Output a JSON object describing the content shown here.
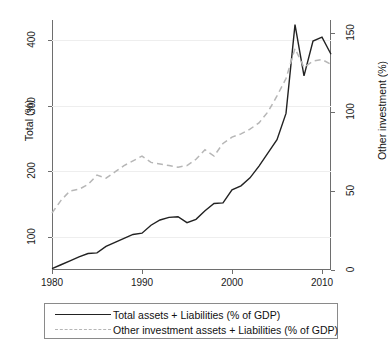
{
  "chart_data": {
    "type": "line",
    "title": "",
    "xlabel": "",
    "ylabel": "Total (%)",
    "y2label": "Other investment (%)",
    "xlim": [
      1980,
      2011
    ],
    "ylim": [
      50,
      430
    ],
    "y2lim": [
      0,
      158
    ],
    "grid": true,
    "grid_axis": "y",
    "legend_position": "bottom",
    "xticks": [
      1980,
      1990,
      2000,
      2010
    ],
    "xtick_labels": [
      "1980",
      "1990",
      "2000",
      "2010"
    ],
    "yticks": [
      100,
      200,
      300,
      400
    ],
    "ytick_labels": [
      "100",
      "200",
      "300",
      "400"
    ],
    "y2ticks": [
      0,
      50,
      100,
      150
    ],
    "y2tick_labels": [
      "0",
      "50",
      "100",
      "150"
    ],
    "x": [
      1980,
      1981,
      1982,
      1983,
      1984,
      1985,
      1986,
      1987,
      1988,
      1989,
      1990,
      1991,
      1992,
      1993,
      1994,
      1995,
      1996,
      1997,
      1998,
      1999,
      2000,
      2001,
      2002,
      2003,
      2004,
      2005,
      2006,
      2007,
      2008,
      2009,
      2010,
      2011
    ],
    "series": [
      {
        "name": "Total assets + Liabilities (% of GDP)",
        "axis": "left",
        "style": "solid",
        "color": "#222222",
        "values": [
          52,
          58,
          64,
          70,
          75,
          76,
          86,
          92,
          98,
          104,
          106,
          118,
          126,
          130,
          131,
          122,
          127,
          140,
          151,
          152,
          172,
          178,
          190,
          208,
          228,
          248,
          288,
          423,
          345,
          398,
          404,
          378
        ]
      },
      {
        "name": "Other investment assets + Liabilities (% of GDP)",
        "axis": "right",
        "style": "dashed",
        "color": "#b6b6b6",
        "values": [
          36,
          44,
          50,
          51,
          54,
          60,
          58,
          62,
          66,
          69,
          72,
          68,
          67,
          66,
          65,
          66,
          70,
          76,
          72,
          80,
          84,
          86,
          89,
          93,
          100,
          110,
          121,
          140,
          128,
          132,
          133,
          130
        ]
      }
    ]
  },
  "axes": {
    "left_title": "Total (%)",
    "right_title": "Other investment (%)"
  },
  "legend": {
    "items": [
      {
        "label": "Total assets + Liabilities (% of GDP)",
        "style": "solid"
      },
      {
        "label": "Other investment assets + Liabilities (% of GDP)",
        "style": "dashed"
      }
    ]
  }
}
